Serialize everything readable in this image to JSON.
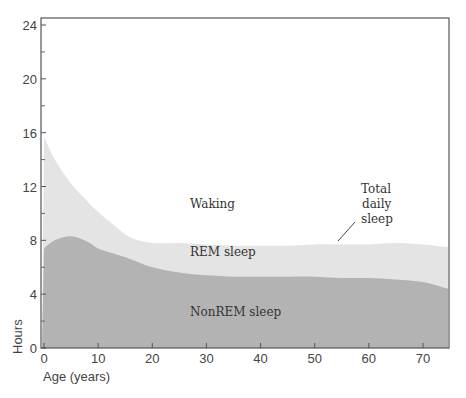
{
  "chart_data": {
    "type": "area",
    "title": "",
    "xlabel": "Age (years)",
    "ylabel": "Hours",
    "xlim": [
      0,
      75
    ],
    "ylim": [
      0,
      24
    ],
    "x_ticks": [
      0,
      10,
      20,
      30,
      40,
      50,
      60,
      70
    ],
    "y_ticks": [
      0,
      4,
      8,
      12,
      16,
      20,
      24
    ],
    "y_minor_ticks": [
      2,
      6,
      10,
      14,
      18,
      22
    ],
    "grid": false,
    "x": [
      0,
      2,
      5,
      8,
      10,
      13,
      16,
      20,
      25,
      30,
      35,
      40,
      45,
      50,
      55,
      60,
      65,
      70,
      75
    ],
    "series": [
      {
        "name": "NonREM sleep",
        "color": "#b3b3b3",
        "values": [
          7.4,
          8.0,
          8.3,
          7.9,
          7.4,
          7.0,
          6.6,
          6.0,
          5.6,
          5.4,
          5.3,
          5.3,
          5.3,
          5.3,
          5.2,
          5.2,
          5.1,
          4.9,
          4.4
        ]
      },
      {
        "name": "REM sleep",
        "color": "#e4e4e4",
        "values": [
          8.3,
          6.0,
          3.9,
          3.0,
          2.7,
          2.1,
          1.6,
          1.8,
          2.2,
          2.3,
          2.3,
          2.3,
          2.3,
          2.4,
          2.5,
          2.5,
          2.7,
          2.8,
          3.1
        ]
      }
    ],
    "total_daily_sleep": [
      15.7,
      14.0,
      12.2,
      10.9,
      10.1,
      9.1,
      8.2,
      7.8,
      7.8,
      7.7,
      7.6,
      7.6,
      7.6,
      7.7,
      7.7,
      7.7,
      7.8,
      7.7,
      7.5
    ],
    "annotations": [
      {
        "text": "Waking",
        "x": 30,
        "y": 11
      },
      {
        "text": "REM sleep",
        "x": 30,
        "y": 7
      },
      {
        "text": "NonREM sleep",
        "x": 30,
        "y": 2.5
      },
      {
        "text": "Total daily sleep",
        "x": 55,
        "y": 10.5,
        "arrow_to": [
          53,
          8
        ]
      }
    ]
  },
  "labels": {
    "xlabel": "Age (years)",
    "ylabel": "Hours",
    "waking": "Waking",
    "rem": "REM sleep",
    "nonrem": "NonREM sleep",
    "total_line1": "Total",
    "total_line2": "daily",
    "total_line3": "sleep"
  }
}
